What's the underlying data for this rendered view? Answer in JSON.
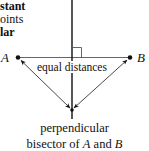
{
  "caption_fragment": {
    "line1": "stant",
    "line2": "oints",
    "line3": "lar"
  },
  "points": {
    "a_label": "A",
    "b_label": "B"
  },
  "annotation": "equal distances",
  "bottom_caption": {
    "line1": "perpendicular",
    "line2_prefix": "bisector of ",
    "line2_a": "A",
    "line2_mid": " and ",
    "line2_b": "B"
  },
  "colors": {
    "line": "#111111",
    "thin_line": "#555555",
    "background": "#ffffff"
  }
}
